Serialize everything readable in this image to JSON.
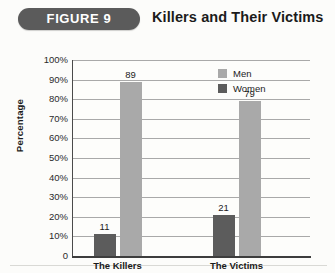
{
  "header": {
    "figure_label": "FIGURE 9",
    "title": "Killers and Their Victims"
  },
  "colors": {
    "banner": "#5b5b5b",
    "men": "#a9a9a9",
    "women": "#5c5c5c",
    "axis": "#3d3d3d",
    "grid": "#a9a9a9",
    "background": "#fcfcfa"
  },
  "chart_data": {
    "type": "bar",
    "title": "Killers and Their Victims",
    "xlabel": "",
    "ylabel": "Percentage",
    "categories": [
      "The Killers",
      "The Victims"
    ],
    "series": [
      {
        "name": "Women",
        "values": [
          11,
          21
        ],
        "color": "#5c5c5c"
      },
      {
        "name": "Men",
        "values": [
          89,
          79
        ],
        "color": "#a9a9a9"
      }
    ],
    "ylim": [
      0,
      100
    ],
    "yticks": [
      0,
      10,
      20,
      30,
      40,
      50,
      60,
      70,
      80,
      90,
      100
    ],
    "ytick_labels": [
      "0",
      "10%",
      "20%",
      "30%",
      "40%",
      "50%",
      "60%",
      "70%",
      "80%",
      "90%",
      "100%"
    ],
    "data_labels": [
      "11",
      "89",
      "21",
      "79"
    ],
    "grid": "horizontal",
    "legend_position": "top-right",
    "legend_entries": [
      "Men",
      "Women"
    ]
  }
}
